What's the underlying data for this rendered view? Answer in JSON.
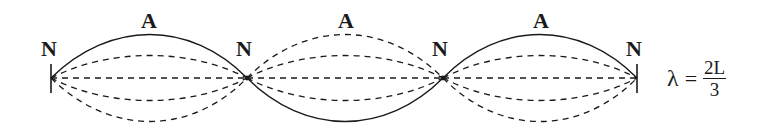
{
  "diagram": {
    "node_label": "N",
    "antinode_label": "A",
    "labels": {
      "nodes": [
        "N",
        "N",
        "N",
        "N"
      ],
      "antinodes": [
        "A",
        "A",
        "A"
      ]
    },
    "equation": {
      "lhs": "λ",
      "equals": "=",
      "numerator": "2L",
      "denominator": "3"
    },
    "colors": {
      "line": "#1a1a1a",
      "background": "#ffffff"
    }
  }
}
